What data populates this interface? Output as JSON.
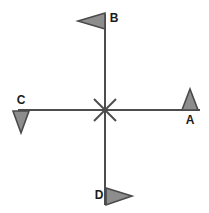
{
  "diagram": {
    "type": "cross-axis-vector-diagram",
    "background_color": "#ffffff",
    "line_color": "#4d4d4d",
    "marker_fill_color": "#8d8d8d",
    "marker_stroke_color": "#4a4a4a",
    "label_color": "#1a1a1a",
    "center_point": {
      "x": 105,
      "y": 110,
      "symbol": "x-cross"
    },
    "axes": [
      {
        "name": "horizontal-axis",
        "x1": 18,
        "y1": 110,
        "x2": 200,
        "y2": 110
      },
      {
        "name": "vertical-axis",
        "x1": 105,
        "y1": 14,
        "x2": 105,
        "y2": 205
      }
    ],
    "center_cross": {
      "name": "center-x-mark",
      "arm_length": 11,
      "strokes": [
        {
          "x1": 94,
          "y1": 99,
          "x2": 116,
          "y2": 121
        },
        {
          "x1": 116,
          "y1": 99,
          "x2": 94,
          "y2": 121
        }
      ]
    },
    "markers": [
      {
        "id": "A",
        "label": "A",
        "name": "marker-a",
        "direction": "up",
        "position": "right-end-of-horizontal-axis",
        "triangle_points": "190,89 198,110 182,110",
        "label_x": 190,
        "label_y": 121
      },
      {
        "id": "B",
        "label": "B",
        "name": "marker-b",
        "direction": "left",
        "position": "top-of-vertical-axis",
        "triangle_points": "78,21 105,13 105,29",
        "label_x": 114,
        "label_y": 19
      },
      {
        "id": "C",
        "label": "C",
        "name": "marker-c",
        "direction": "down",
        "position": "left-end-of-horizontal-axis",
        "triangle_points": "13,111 29,111 21,133",
        "label_x": 21,
        "label_y": 101
      },
      {
        "id": "D",
        "label": "D",
        "name": "marker-d",
        "direction": "right",
        "position": "bottom-of-vertical-axis",
        "triangle_points": "106,188 132,196 106,205",
        "label_x": 99,
        "label_y": 196
      }
    ]
  }
}
